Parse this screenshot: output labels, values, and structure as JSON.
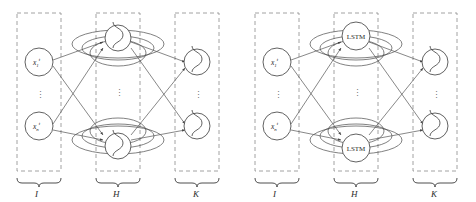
{
  "figure": {
    "type": "neural-network-diagram",
    "background_color": "#ffffff",
    "stroke_color": "#3a3a3a",
    "dash_color": "#8a8a8a",
    "edge_color": "#555555"
  },
  "panels": [
    {
      "id": "left",
      "name": "simple-recurrent-network",
      "layers": [
        {
          "id": "input",
          "group_label": "I",
          "nodes": [
            {
              "base": "x",
              "sub": "1",
              "sup": "t"
            },
            {
              "base": "x",
              "sub": "n",
              "sup": "t"
            }
          ],
          "ellipsis": "⋮",
          "node_glyph": "sigmoid-curve"
        },
        {
          "id": "hidden",
          "group_label": "H",
          "nodes": [
            {
              "text": ""
            },
            {
              "text": ""
            }
          ],
          "ellipsis": "⋮",
          "node_glyph": "sigmoid-curve",
          "recurrent": true
        },
        {
          "id": "output",
          "group_label": "K",
          "nodes": [
            {
              "text": ""
            },
            {
              "text": ""
            }
          ],
          "ellipsis": "⋮",
          "node_glyph": "sigmoid-curve"
        }
      ]
    },
    {
      "id": "right",
      "name": "lstm-recurrent-network",
      "layers": [
        {
          "id": "input",
          "group_label": "I",
          "nodes": [
            {
              "base": "x",
              "sub": "1",
              "sup": "t"
            },
            {
              "base": "x",
              "sub": "n",
              "sup": "t"
            }
          ],
          "ellipsis": "⋮",
          "node_glyph": "sigmoid-curve"
        },
        {
          "id": "hidden",
          "group_label": "H",
          "nodes": [
            {
              "text": "LSTM"
            },
            {
              "text": "LSTM"
            }
          ],
          "ellipsis": "⋮",
          "node_glyph": "text",
          "recurrent": true
        },
        {
          "id": "output",
          "group_label": "K",
          "nodes": [
            {
              "text": ""
            },
            {
              "text": ""
            }
          ],
          "ellipsis": "⋮",
          "node_glyph": "sigmoid-curve"
        }
      ]
    }
  ]
}
